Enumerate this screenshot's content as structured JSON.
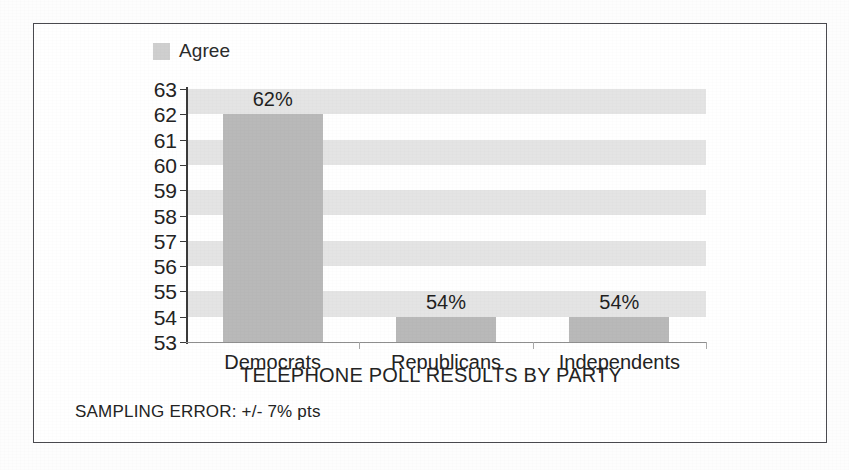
{
  "chart_data": {
    "type": "bar",
    "title": "",
    "xlabel": "TELEPHONE POLL RESULTS BY PARTY",
    "ylabel": "",
    "categories": [
      "Democrats",
      "Republicans",
      "Independents"
    ],
    "values": [
      62,
      54,
      54
    ],
    "value_labels": [
      "62%",
      "54%",
      "54%"
    ],
    "series": [
      {
        "name": "Agree",
        "values": [
          62,
          54,
          54
        ]
      }
    ],
    "ylim": [
      53,
      63
    ],
    "y_ticks": [
      63,
      62,
      61,
      60,
      59,
      58,
      57,
      56,
      55,
      54,
      53
    ],
    "grid": "horizontal-bands",
    "legend_position": "top-left",
    "bar_color": "#b9b9b9",
    "band_color": "#e4e4e4",
    "footnote": "SAMPLING ERROR: +/- 7% pts"
  },
  "legend": {
    "entries": [
      {
        "label": "Agree",
        "color": "#cfcfcf"
      }
    ]
  },
  "axis": {
    "x_title": "TELEPHONE POLL RESULTS BY PARTY"
  },
  "footnote": {
    "text": "SAMPLING ERROR: +/- 7% pts"
  }
}
